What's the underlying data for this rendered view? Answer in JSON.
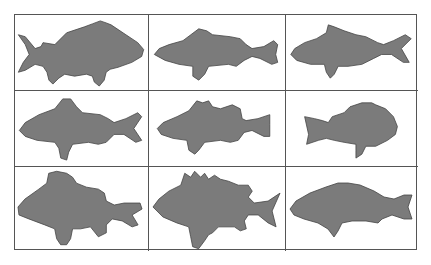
{
  "figure": {
    "type": "silhouette-grid",
    "rows": 3,
    "columns": 3,
    "fill_color": "#7b7b7b",
    "outline_color": "#444444",
    "grid_line_color": "#555555",
    "background": "#ffffff",
    "cells": [
      {
        "row": 1,
        "col": 1,
        "subject": "fish-silhouette",
        "shape": "deep-bodied spiny-dorsal fish facing right, forked tail left"
      },
      {
        "row": 1,
        "col": 2,
        "subject": "fish-silhouette",
        "shape": "bass-like fish facing left, forked tail right"
      },
      {
        "row": 1,
        "col": 3,
        "subject": "fish-silhouette",
        "shape": "snapper-like fish facing left, forked tail right"
      },
      {
        "row": 2,
        "col": 1,
        "subject": "fish-silhouette",
        "shape": "carp-like fish facing left, forked tail right"
      },
      {
        "row": 2,
        "col": 2,
        "subject": "fish-silhouette",
        "shape": "perch-like fish with spiny dorsal facing left"
      },
      {
        "row": 2,
        "col": 3,
        "subject": "fish-silhouette",
        "shape": "sunfish-like deep body facing right, tail left"
      },
      {
        "row": 3,
        "col": 1,
        "subject": "fish-silhouette",
        "shape": "deep-bodied fish with tall dorsal facing left"
      },
      {
        "row": 3,
        "col": 2,
        "subject": "fish-silhouette",
        "shape": "spiny fish with jagged dorsal facing left"
      },
      {
        "row": 3,
        "col": 3,
        "subject": "fish-silhouette",
        "shape": "wrasse-like slender fish facing left"
      }
    ]
  }
}
